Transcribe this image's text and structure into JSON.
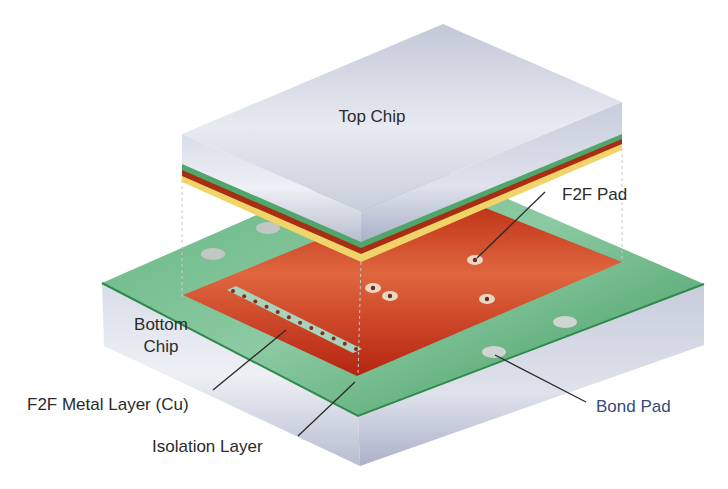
{
  "figure": {
    "type": "3D stacking diagram (face-to-face bonded chips)",
    "labels": {
      "top_chip": "Top Chip",
      "f2f_pad": "F2F Pad",
      "bottom_chip_line1": "Bottom",
      "bottom_chip_line2": "Chip",
      "f2f_metal_layer": "F2F Metal Layer (Cu)",
      "isolation_layer": "Isolation Layer",
      "bond_pad": "Bond Pad"
    },
    "colors": {
      "silicon": "#c5cad8",
      "silicon_light": "#e4e7ef",
      "isolation_green": "#4fa56a",
      "copper_red": "#c43a1c",
      "yellow_layer": "#f0d46a",
      "label_text": "#2b2b2b",
      "bond_pad_text": "#3a4a7a"
    }
  }
}
